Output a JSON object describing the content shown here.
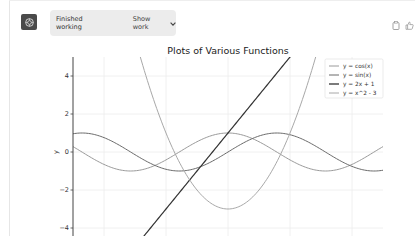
{
  "header": {
    "status_label": "Finished working",
    "show_work_label": "Show work",
    "chevron_icon": "chevron-down-icon",
    "avatar_icon": "openai-logo-icon",
    "actions": [
      {
        "name": "copy-icon"
      },
      {
        "name": "thumbs-up-icon"
      }
    ]
  },
  "chart_data": {
    "type": "line",
    "title": "Plots of Various Functions",
    "xlabel": "",
    "ylabel": "y",
    "xlim": [
      -5,
      5
    ],
    "ylim": [
      -5,
      5
    ],
    "grid": true,
    "legend_position": "upper right",
    "x_ticks": [
      -4,
      -2,
      0,
      2,
      4
    ],
    "y_ticks": [
      4,
      2,
      0,
      -2,
      -4
    ],
    "y_tick_labels": [
      "4",
      "2",
      "0",
      "−2",
      "−4"
    ],
    "series": [
      {
        "name": "y = cos(x)",
        "expr": "cos",
        "color": "#9a9a9a"
      },
      {
        "name": "y = sin(x)",
        "expr": "sin",
        "color": "#6a6a6a"
      },
      {
        "name": "y = 2x + 1",
        "expr": "lin",
        "color": "#333333"
      },
      {
        "name": "y = x^2 - 3",
        "expr": "quad",
        "color": "#a8a8a8"
      }
    ]
  }
}
